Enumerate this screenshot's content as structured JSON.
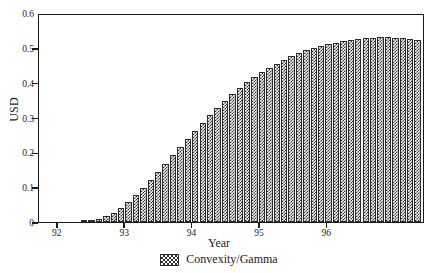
{
  "chart_data": {
    "type": "bar",
    "title": "",
    "xlabel": "Year",
    "ylabel": "USD",
    "ylim": [
      0,
      0.6
    ],
    "xlim": [
      91.72,
      97.45
    ],
    "grid": false,
    "legend_position": "bottom-center",
    "series": [
      {
        "name": "Convexity/Gamma",
        "x": [
          91.84,
          91.95,
          92.06,
          92.17,
          92.28,
          92.39,
          92.5,
          92.61,
          92.72,
          92.83,
          92.94,
          93.05,
          93.16,
          93.27,
          93.38,
          93.49,
          93.6,
          93.71,
          93.82,
          93.93,
          94.04,
          94.15,
          94.26,
          94.37,
          94.48,
          94.59,
          94.7,
          94.81,
          94.92,
          95.03,
          95.14,
          95.25,
          95.36,
          95.47,
          95.58,
          95.69,
          95.8,
          95.91,
          96.02,
          96.13,
          96.24,
          96.35,
          96.46,
          96.57,
          96.68,
          96.79,
          96.9,
          97.01,
          97.12,
          97.23,
          97.34
        ],
        "values": [
          0.0,
          0.0,
          0.0,
          0.0,
          0.0,
          0.001,
          0.003,
          0.008,
          0.016,
          0.027,
          0.041,
          0.058,
          0.077,
          0.098,
          0.12,
          0.143,
          0.167,
          0.191,
          0.215,
          0.239,
          0.262,
          0.285,
          0.307,
          0.328,
          0.348,
          0.367,
          0.385,
          0.401,
          0.416,
          0.43,
          0.443,
          0.455,
          0.466,
          0.476,
          0.485,
          0.493,
          0.5,
          0.506,
          0.511,
          0.515,
          0.519,
          0.522,
          0.525,
          0.527,
          0.529,
          0.53,
          0.53,
          0.529,
          0.527,
          0.525,
          0.522
        ]
      }
    ],
    "yticks": [
      {
        "value": 0.6,
        "label": "0.6"
      },
      {
        "value": 0.5,
        "label": "0.5"
      },
      {
        "value": 0.4,
        "label": "0.4"
      },
      {
        "value": 0.3,
        "label": "0.3"
      },
      {
        "value": 0.2,
        "label": "0.2"
      },
      {
        "value": 0.1,
        "label": "0.1"
      },
      {
        "value": 0.0,
        "label": "0"
      }
    ],
    "xticks": [
      {
        "value": 92,
        "label": "92"
      },
      {
        "value": 93,
        "label": "93"
      },
      {
        "value": 94,
        "label": "94"
      },
      {
        "value": 95,
        "label": "95"
      },
      {
        "value": 96,
        "label": "96"
      }
    ],
    "legend": [
      {
        "label": "Convexity/Gamma",
        "pattern": "checkerboard-hatch",
        "color": "#2b2b2b"
      }
    ]
  },
  "axes": {
    "ylabel": "USD",
    "xlabel": "Year"
  },
  "legend": {
    "entry_label": "Convexity/Gamma"
  }
}
